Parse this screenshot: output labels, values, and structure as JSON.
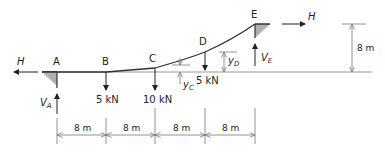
{
  "diagram": {
    "type": "suspension cable with point loads",
    "points": [
      {
        "id": "A",
        "label": "A",
        "x_m": 0,
        "y_m": 0
      },
      {
        "id": "B",
        "label": "B",
        "x_m": 8
      },
      {
        "id": "C",
        "label": "C",
        "x_m": 16
      },
      {
        "id": "D",
        "label": "D",
        "x_m": 24
      },
      {
        "id": "E",
        "label": "E",
        "x_m": 32,
        "y_m": 8
      }
    ],
    "loads": [
      {
        "at": "B",
        "label": "5 kN"
      },
      {
        "at": "C",
        "label": "10 kN"
      },
      {
        "at": "D",
        "label": "5 kN"
      }
    ],
    "reactions": {
      "horizontal_left": "H",
      "horizontal_right": "H",
      "vertical_A": "V",
      "vertical_A_sub": "A",
      "vertical_E": "V",
      "vertical_E_sub": "E"
    },
    "sag_labels": {
      "C": {
        "symbol": "y",
        "sub": "C"
      },
      "D": {
        "symbol": "y",
        "sub": "D"
      }
    },
    "span_dimensions": [
      "8 m",
      "8 m",
      "8 m",
      "8 m"
    ],
    "height_dimension": "8 m",
    "colors": {
      "line": "#333333",
      "support_fill": "#b0b0b0",
      "dimension": "#777777"
    }
  }
}
